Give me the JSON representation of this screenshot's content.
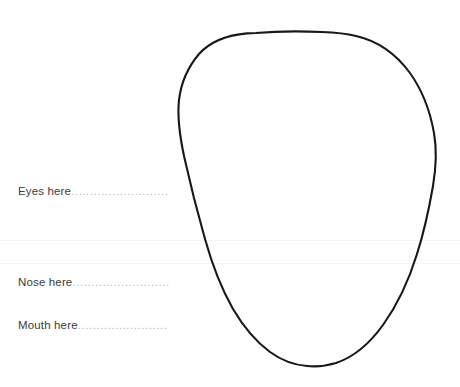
{
  "worksheet": {
    "title": "Face drawing template",
    "background_color": "#ffffff",
    "width": 460,
    "height": 387
  },
  "face": {
    "name": "face-outline",
    "shape": "egg-oval",
    "stroke_color": "#181818",
    "stroke_width": 2.1,
    "fill": "none",
    "top_y": 33,
    "bottom_y": 365,
    "left_x": 178,
    "right_x": 435,
    "center_x": 307
  },
  "guides": [
    {
      "name": "guide-rule-upper",
      "y": 240,
      "color": "#f4f4f5"
    },
    {
      "name": "guide-rule-lower",
      "y": 263,
      "color": "#f4f4f5"
    }
  ],
  "labels": [
    {
      "id": "eyes",
      "text": "Eyes here",
      "leader": "..........................",
      "y": 190,
      "text_color": "#3c3c3c",
      "leader_color": "#b8b8b8"
    },
    {
      "id": "nose",
      "text": "Nose here",
      "leader": "..........................",
      "y": 281,
      "text_color": "#3c3c3c",
      "leader_color": "#b8b8b8"
    },
    {
      "id": "mouth",
      "text": "Mouth here",
      "leader": "........................",
      "y": 324,
      "text_color": "#3c3c3c",
      "leader_color": "#b8b8b8"
    }
  ]
}
